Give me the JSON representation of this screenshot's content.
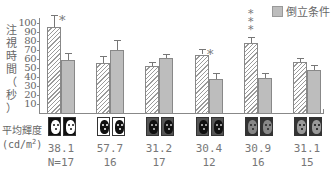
{
  "chart_data": {
    "type": "bar",
    "title": "",
    "ylabel": "注視時間（秒）",
    "xlabel": "",
    "ylim": [
      0,
      100
    ],
    "yticks": [
      10,
      20,
      30,
      40,
      50,
      60,
      70,
      80,
      90,
      100
    ],
    "legend": {
      "position": "top-right",
      "entries": [
        {
          "label": "倒立条件",
          "style": "gray-fill"
        }
      ]
    },
    "categories": [
      "38.1 / N=17",
      "57.7 / 16",
      "31.2 / 17",
      "30.4 / 12",
      "30.9 / 16",
      "31.1 / 15"
    ],
    "series": [
      {
        "name": "正立条件 (hatched)",
        "values": [
          96,
          56,
          52,
          65,
          78,
          57
        ],
        "errors": [
          13,
          7,
          5,
          6,
          6,
          4
        ]
      },
      {
        "name": "倒立条件",
        "values": [
          59,
          70,
          61,
          38,
          39,
          48
        ],
        "errors": [
          8,
          11,
          5,
          7,
          5,
          5
        ]
      }
    ],
    "significance": [
      {
        "group": 0,
        "marker": "*"
      },
      {
        "group": 3,
        "marker": "*"
      },
      {
        "group": 4,
        "marker": "***"
      }
    ],
    "footer": {
      "row_label": "平均輝度",
      "row_unit": "(cd/m²)",
      "luminance": [
        "38.1",
        "57.7",
        "31.2",
        "30.4",
        "30.9",
        "31.1"
      ],
      "n": [
        "N=17",
        "16",
        "17",
        "12",
        "16",
        "15"
      ]
    }
  },
  "yaxis": {
    "label_chars": [
      "注",
      "視",
      "時",
      "間",
      "（",
      "秒",
      "）"
    ],
    "ticks": [
      "100",
      "90",
      "80",
      "70",
      "60",
      "50",
      "40",
      "30",
      "20",
      "10"
    ]
  },
  "legend": {
    "label": "倒立条件"
  },
  "footer": {
    "row_label": "平均輝度",
    "row_unit": "(cd/m²)",
    "groups": [
      {
        "lum": "38.1",
        "n": "N=17",
        "thumb_bg": "#111111",
        "face": "#ffffff",
        "eye": "#111111"
      },
      {
        "lum": "57.7",
        "n": "16",
        "thumb_bg": "#ffffff",
        "face": "#111111",
        "eye": "#ffffff"
      },
      {
        "lum": "31.2",
        "n": "17",
        "thumb_bg": "#555555",
        "face": "#111111",
        "eye": "#cccccc"
      },
      {
        "lum": "30.4",
        "n": "12",
        "thumb_bg": "#555555",
        "face": "#111111",
        "eye": "#cccccc"
      },
      {
        "lum": "30.9",
        "n": "16",
        "thumb_bg": "#333333",
        "face": "#888888",
        "eye": "#222222"
      },
      {
        "lum": "31.1",
        "n": "15",
        "thumb_bg": "#333333",
        "face": "#999999",
        "eye": "#111111"
      }
    ]
  },
  "colors": {
    "hatch": "#9a9a9a",
    "gray_bar": "#bdbdbd",
    "axis": "#888888",
    "text": "#666666"
  }
}
